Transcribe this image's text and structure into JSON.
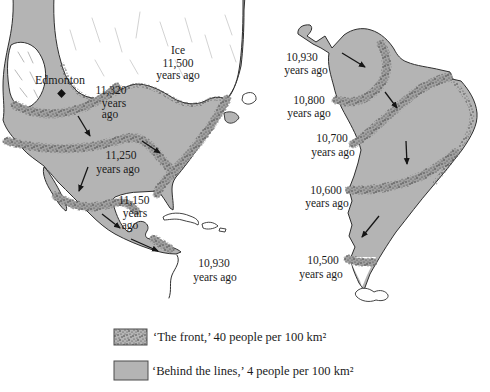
{
  "north_america_map": {
    "city_label": "Edmonton",
    "ice_label": {
      "lines": [
        "Ice",
        "11,500",
        "years ago"
      ]
    },
    "front_labels": [
      {
        "lines": [
          "11,320",
          "years",
          "ago"
        ]
      },
      {
        "lines": [
          "11,250",
          "years ago"
        ]
      },
      {
        "lines": [
          "11,150",
          "years",
          "ago"
        ]
      },
      {
        "lines": [
          "10,930",
          "years ago"
        ]
      }
    ]
  },
  "south_america_map": {
    "front_labels": [
      {
        "lines": [
          "10,930",
          "years ago"
        ]
      },
      {
        "lines": [
          "10,800",
          "years ago"
        ]
      },
      {
        "lines": [
          "10,700",
          "years ago"
        ]
      },
      {
        "lines": [
          "10,600",
          "years ago"
        ]
      },
      {
        "lines": [
          "10,500",
          "years ago"
        ]
      }
    ]
  },
  "legend": {
    "items": [
      {
        "swatch": "front-stipple-swatch",
        "label": "‘The front,’ 40 people per 100 km²"
      },
      {
        "swatch": "behind-plain-swatch",
        "label": "‘Behind the lines,’ 4 people per 100 km²"
      }
    ]
  },
  "colors": {
    "land_gray": "#b4b4b4",
    "stipple_dark": "#3d3d3d",
    "outline": "#2f2f2f",
    "ice_white": "#ffffff",
    "text": "#1b1b1b"
  }
}
